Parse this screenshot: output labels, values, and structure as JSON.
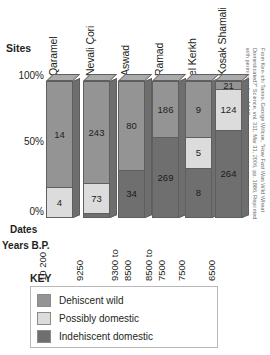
{
  "chart_data": {
    "type": "bar",
    "title": "",
    "subtype": "stacked-percentage-3d",
    "xlabel": "Sites",
    "ylabel": "",
    "ylim": [
      0,
      100
    ],
    "ytick_labels": [
      "100%",
      "50%",
      "0%"
    ],
    "ytick_values": [
      100,
      50,
      0
    ],
    "categories": [
      "Qaramel",
      "Nevali Çori",
      "Aswad",
      "Ramad",
      "el Kerkh",
      "Kosak Shamali"
    ],
    "x2_label_line1": "Dates",
    "x2_label_line2": "Years B.P.",
    "x2_tick_labels": [
      "10 200",
      "9250",
      "9300 to 8500",
      "8500 to 7500",
      "7500",
      "6500"
    ],
    "series": [
      {
        "name": "Dehiscent wild",
        "color": "#949494",
        "values": [
          14,
          243,
          80,
          186,
          9,
          21
        ]
      },
      {
        "name": "Possibly domestic",
        "color": "#dcdcdc",
        "values": [
          4,
          73,
          0,
          0,
          5,
          124
        ]
      },
      {
        "name": "Indehiscent domestic",
        "color": "#6f6f6f",
        "values": [
          0,
          9,
          34,
          269,
          8,
          264
        ]
      }
    ],
    "legend_title": "KEY",
    "legend_position": "bottom-left",
    "grid": false
  },
  "sites_axis": {
    "title": "Sites",
    "labels": [
      "Qaramel",
      "Nevali Çori",
      "Aswad",
      "Ramad",
      "el Kerkh",
      "Kosak Shamali"
    ]
  },
  "y_axis": {
    "ticks": [
      "100%",
      "50%",
      "0%"
    ]
  },
  "dates_axis": {
    "title_line1": "Dates",
    "title_line2": "Years B.P.",
    "labels": [
      "10 200",
      "9250",
      "9300 to 8500",
      "8500 to 7500",
      "7500",
      "6500"
    ]
  },
  "bars": [
    {
      "site": "Qaramel",
      "segments": [
        {
          "key": "wild",
          "label": "14",
          "percent": 78
        },
        {
          "key": "poss",
          "label": "4",
          "percent": 22
        }
      ]
    },
    {
      "site": "Nevali Çori",
      "segments": [
        {
          "key": "wild",
          "label": "243",
          "percent": 74.5
        },
        {
          "key": "poss",
          "label": "73",
          "percent": 22.5
        },
        {
          "key": "indeh",
          "label": "",
          "percent": 3
        }
      ]
    },
    {
      "site": "Aswad",
      "segments": [
        {
          "key": "wild",
          "label": "80",
          "percent": 65
        },
        {
          "key": "indeh",
          "label": "34",
          "percent": 35
        }
      ]
    },
    {
      "site": "Ramad",
      "segments": [
        {
          "key": "wild",
          "label": "186",
          "percent": 41
        },
        {
          "key": "indeh",
          "label": "269",
          "percent": 59
        }
      ]
    },
    {
      "site": "el Kerkh",
      "segments": [
        {
          "key": "wild",
          "label": "9",
          "percent": 41
        },
        {
          "key": "poss",
          "label": "5",
          "percent": 22.7
        },
        {
          "key": "indeh",
          "label": "8",
          "percent": 36.3
        }
      ]
    },
    {
      "site": "Kosak Shamali",
      "segments": [
        {
          "key": "wild",
          "label": "21",
          "percent": 5.2
        },
        {
          "key": "poss",
          "label": "124",
          "percent": 30.3
        },
        {
          "key": "indeh",
          "label": "264",
          "percent": 64.5
        }
      ]
    }
  ],
  "legend": {
    "title": "KEY",
    "items": [
      {
        "swatch": "wild",
        "label": "Dehiscent wild"
      },
      {
        "swatch": "poss",
        "label": "Possibly domestic"
      },
      {
        "swatch": "indeh",
        "label": "Indehiscent domestic"
      }
    ]
  },
  "credit": {
    "text": "From Ken-ichi Tanno, George Willcox, \"How Fast Was Wild Wheat Domesticated?\" Science, vol. 311, Mar 31, 2006, pp. 1886. Reprinted with permission from AAAS."
  }
}
